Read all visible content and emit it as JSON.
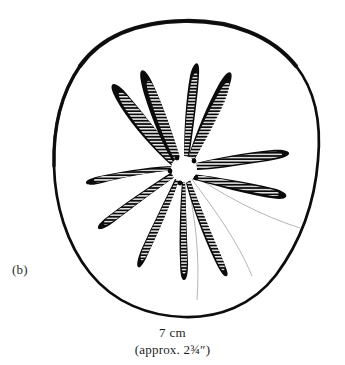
{
  "figure": {
    "panel_label": "(b)",
    "subject_name": "sand-dollar-dorsal-view",
    "caption": {
      "size_metric": "7 cm",
      "size_imperial": "(approx. 2¾″)"
    },
    "colors": {
      "ink": "#111111",
      "outline": "#0d0d0d",
      "paper": "#ffffff",
      "stipple": "#1b1b1b"
    },
    "body": {
      "shape": "rounded-pentagonal-disc",
      "center_x": 184,
      "center_y": 169,
      "radius_x": 132,
      "radius_y": 148,
      "outline_width": 2.6
    },
    "petals": {
      "count": 10,
      "description": "petaloid ambulacra radiating from apical centre",
      "angles_deg": [
        268,
        304,
        340,
        16,
        52,
        88,
        124,
        160,
        196,
        232
      ],
      "inner_radius": 16,
      "outer_radius": 112
    },
    "apical_pores": {
      "count": 5,
      "radius": 2.4
    }
  }
}
